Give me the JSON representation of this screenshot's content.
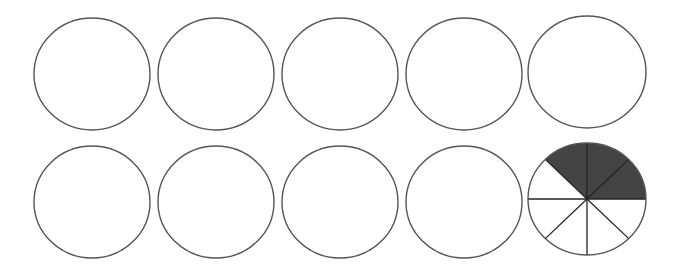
{
  "figure": {
    "stroke_color": "#555555",
    "shade_color": "#444444",
    "line_color": "#222222",
    "rows": [
      {
        "circles": [
          {
            "cx": 92,
            "cy": 74,
            "rx": 58,
            "ry": 56,
            "divisions": 0,
            "shaded": 0
          },
          {
            "cx": 216,
            "cy": 74,
            "rx": 58,
            "ry": 56,
            "divisions": 0,
            "shaded": 0
          },
          {
            "cx": 340,
            "cy": 74,
            "rx": 58,
            "ry": 56,
            "divisions": 0,
            "shaded": 0
          },
          {
            "cx": 464,
            "cy": 74,
            "rx": 58,
            "ry": 56,
            "divisions": 0,
            "shaded": 0
          },
          {
            "cx": 587,
            "cy": 72,
            "rx": 59,
            "ry": 56,
            "divisions": 0,
            "shaded": 0
          }
        ]
      },
      {
        "circles": [
          {
            "cx": 92,
            "cy": 202,
            "rx": 58,
            "ry": 56,
            "divisions": 0,
            "shaded": 0
          },
          {
            "cx": 216,
            "cy": 202,
            "rx": 58,
            "ry": 56,
            "divisions": 0,
            "shaded": 0
          },
          {
            "cx": 340,
            "cy": 202,
            "rx": 58,
            "ry": 56,
            "divisions": 0,
            "shaded": 0
          },
          {
            "cx": 464,
            "cy": 202,
            "rx": 58,
            "ry": 56,
            "divisions": 0,
            "shaded": 0
          },
          {
            "cx": 587,
            "cy": 199,
            "rx": 59,
            "ry": 56,
            "divisions": 8,
            "shaded": 3,
            "shaded_start_deg": 0,
            "shaded_end_deg": 135
          }
        ]
      }
    ],
    "fraction": {
      "shaded_parts": 3,
      "total_parts": 8
    }
  }
}
